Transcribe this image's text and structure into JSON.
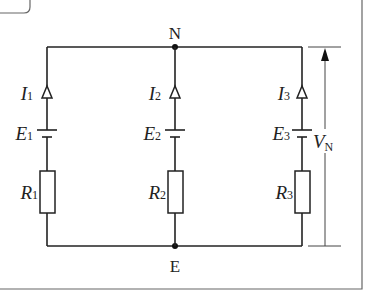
{
  "diagram": {
    "type": "circuit",
    "nodes": {
      "top": {
        "label": "N"
      },
      "bottom": {
        "label": "E"
      }
    },
    "branches": [
      {
        "current": {
          "symbol": "I",
          "sub": "1"
        },
        "emf": {
          "symbol": "E",
          "sub": "1"
        },
        "resistor": {
          "symbol": "R",
          "sub": "1"
        }
      },
      {
        "current": {
          "symbol": "I",
          "sub": "2"
        },
        "emf": {
          "symbol": "E",
          "sub": "2"
        },
        "resistor": {
          "symbol": "R",
          "sub": "2"
        }
      },
      {
        "current": {
          "symbol": "I",
          "sub": "3"
        },
        "emf": {
          "symbol": "E",
          "sub": "3"
        },
        "resistor": {
          "symbol": "R",
          "sub": "3"
        }
      }
    ],
    "voltage": {
      "symbol": "V",
      "sub": "N"
    },
    "colors": {
      "wire": "#222222",
      "frame": "#666666",
      "background": "#ffffff"
    }
  }
}
